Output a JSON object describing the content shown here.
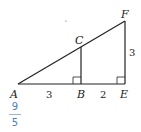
{
  "diagram": {
    "points": {
      "A": {
        "label": "A"
      },
      "B": {
        "label": "B"
      },
      "C": {
        "label": "C"
      },
      "E": {
        "label": "E"
      },
      "F": {
        "label": "F"
      }
    },
    "lengths": {
      "AB": "3",
      "BE": "2",
      "EF": "3"
    },
    "right_angles": [
      "B",
      "E"
    ]
  },
  "answer": {
    "numerator": "9",
    "denominator": "5",
    "color": "#4a7fc1"
  }
}
